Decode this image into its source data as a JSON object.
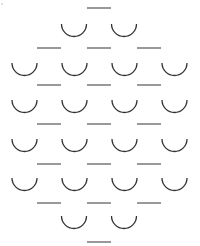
{
  "diagram": {
    "title": "",
    "colors": {
      "cup": "#333333",
      "dash": "#555555",
      "background": "#ffffff"
    },
    "rows": [
      {
        "kind": "dash",
        "count": 1
      },
      {
        "kind": "cup",
        "count": 2
      },
      {
        "kind": "dash",
        "count": 3
      },
      {
        "kind": "cup",
        "count": 4
      },
      {
        "kind": "dash",
        "count": 3
      },
      {
        "kind": "cup",
        "count": 4
      },
      {
        "kind": "dash",
        "count": 3
      },
      {
        "kind": "cup",
        "count": 4
      },
      {
        "kind": "dash",
        "count": 3
      },
      {
        "kind": "cup",
        "count": 4
      },
      {
        "kind": "dash",
        "count": 3
      },
      {
        "kind": "cup",
        "count": 2
      },
      {
        "kind": "dash",
        "count": 1
      }
    ]
  }
}
